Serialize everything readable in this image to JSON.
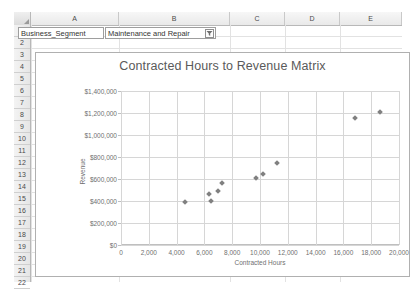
{
  "spreadsheet": {
    "columns": [
      "A",
      "B",
      "C",
      "D",
      "E"
    ],
    "rows": [
      "1",
      "2",
      "3",
      "4",
      "5",
      "6",
      "7",
      "8",
      "9",
      "10",
      "11",
      "12",
      "13",
      "14",
      "15",
      "16",
      "17",
      "18",
      "19",
      "20",
      "21",
      "22"
    ],
    "cells": {
      "A2": "Business_Segment",
      "B2": "Maintenance and Repair"
    },
    "filter_icon": "filter-funnel-icon"
  },
  "chart_data": {
    "type": "scatter",
    "title": "Contracted Hours to Revenue Matrix",
    "xlabel": "Contracted Hours",
    "ylabel": "Revenue",
    "xlim": [
      0,
      20000
    ],
    "ylim": [
      0,
      1400000
    ],
    "grid": true,
    "legend": "none",
    "marker_color": "#808080",
    "xticks": [
      "0",
      "2,000",
      "4,000",
      "6,000",
      "8,000",
      "10,000",
      "12,000",
      "14,000",
      "16,000",
      "18,000",
      "20,000"
    ],
    "xtick_values": [
      0,
      2000,
      4000,
      6000,
      8000,
      10000,
      12000,
      14000,
      16000,
      18000,
      20000
    ],
    "yticks": [
      "$0",
      "$200,000",
      "$400,000",
      "$600,000",
      "$800,000",
      "$1,000,000",
      "$1,200,000",
      "$1,400,000"
    ],
    "ytick_values": [
      0,
      200000,
      400000,
      600000,
      800000,
      1000000,
      1200000,
      1400000
    ],
    "points": [
      {
        "x": 4600,
        "y": 390000
      },
      {
        "x": 6300,
        "y": 468000
      },
      {
        "x": 6500,
        "y": 398000
      },
      {
        "x": 7000,
        "y": 492000
      },
      {
        "x": 7300,
        "y": 562000
      },
      {
        "x": 9700,
        "y": 608000
      },
      {
        "x": 10200,
        "y": 648000
      },
      {
        "x": 11200,
        "y": 748000
      },
      {
        "x": 16800,
        "y": 1152000
      },
      {
        "x": 18600,
        "y": 1212000
      }
    ]
  }
}
